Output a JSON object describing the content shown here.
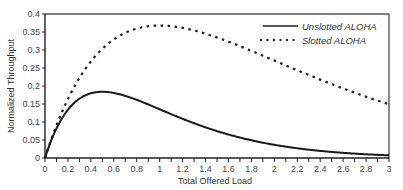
{
  "chart_data": {
    "type": "line",
    "title": "",
    "xlabel": "Total Offered Load",
    "ylabel": "Normalized Throughput",
    "xlim": [
      0,
      3
    ],
    "ylim": [
      0,
      0.4
    ],
    "grid": false,
    "legend_position": "upper right",
    "x_ticks": [
      "0",
      "0.2",
      "0.4",
      "0.6",
      "0.8",
      "1",
      "1.2",
      "1.4",
      "1.6",
      "1.8",
      "2",
      "2.2",
      "2.4",
      "2.6",
      "2.8",
      "3"
    ],
    "y_ticks": [
      "0",
      "0.05",
      "0.1",
      "0.15",
      "0.2",
      "0.25",
      "0.3",
      "0.35",
      "0.4"
    ],
    "x": [
      0,
      0.1,
      0.2,
      0.3,
      0.4,
      0.5,
      0.6,
      0.7,
      0.8,
      0.9,
      1.0,
      1.2,
      1.4,
      1.6,
      1.8,
      2.0,
      2.2,
      2.4,
      2.6,
      2.8,
      3.0
    ],
    "series": [
      {
        "name": "Unslotted ALOHA",
        "style": "solid",
        "color": "#1a1a1a",
        "values": [
          0,
          0.082,
          0.134,
          0.165,
          0.18,
          0.184,
          0.181,
          0.173,
          0.162,
          0.149,
          0.135,
          0.109,
          0.085,
          0.065,
          0.049,
          0.037,
          0.027,
          0.02,
          0.014,
          0.01,
          0.007
        ]
      },
      {
        "name": "Slotted ALOHA",
        "style": "dashed",
        "color": "#1a1a1a",
        "values": [
          0,
          0.09,
          0.164,
          0.222,
          0.268,
          0.303,
          0.329,
          0.348,
          0.359,
          0.366,
          0.368,
          0.361,
          0.345,
          0.323,
          0.298,
          0.271,
          0.244,
          0.218,
          0.193,
          0.17,
          0.149
        ]
      }
    ]
  },
  "legend": {
    "items": [
      {
        "label": "Unslotted ALOHA",
        "style": "solid"
      },
      {
        "label": "Slotted ALOHA",
        "style": "dashed"
      }
    ]
  }
}
